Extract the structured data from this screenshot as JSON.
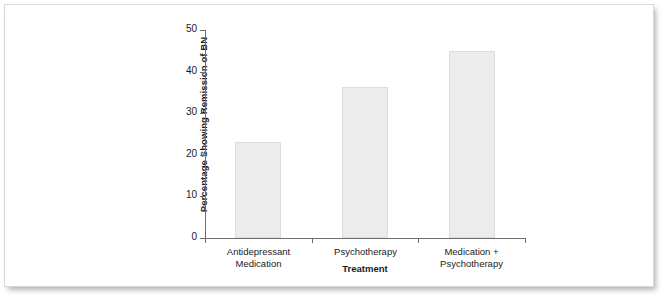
{
  "chart_data": {
    "type": "bar",
    "title": "",
    "xlabel": "Treatment",
    "ylabel": "Percentage Showing Remission of BN",
    "categories": [
      "Antidepressant\nMedication",
      "Psychotherapy",
      "Medication +\nPsychotherapy"
    ],
    "values": [
      23,
      36.4,
      45
    ],
    "ylim": [
      0,
      50
    ],
    "yticks": [
      0,
      10,
      20,
      30,
      40,
      50
    ],
    "ytick_labels": [
      "0",
      "10",
      "20",
      "30",
      "40",
      "50"
    ],
    "grid": false,
    "legend": "none",
    "bar_color": "#ececec",
    "bar_edge_color": "#dcdcdc",
    "axis_color": "#6e6e6e",
    "text_color": "#1a1a1a"
  }
}
